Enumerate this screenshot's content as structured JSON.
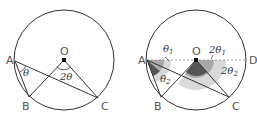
{
  "figures": [
    {
      "id": "left",
      "points": {
        "A": {
          "label": "A",
          "x": 15,
          "y": 61
        },
        "B": {
          "label": "B",
          "x": 29,
          "y": 97
        },
        "C": {
          "label": "C",
          "x": 98,
          "y": 98
        },
        "O": {
          "label": "O",
          "x": 64,
          "y": 60
        }
      },
      "circle": {
        "cx": 64,
        "cy": 61,
        "r": 50
      },
      "angles": [
        {
          "at": "A",
          "label": "θ",
          "sub": ""
        },
        {
          "at": "O",
          "label": "2θ",
          "sub": ""
        }
      ]
    },
    {
      "id": "right",
      "points": {
        "A": {
          "label": "A",
          "x": 147,
          "y": 60
        },
        "B": {
          "label": "B",
          "x": 161,
          "y": 97
        },
        "C": {
          "label": "C",
          "x": 229,
          "y": 97
        },
        "O": {
          "label": "O",
          "x": 196,
          "y": 60
        },
        "D": {
          "label": "D",
          "x": 246,
          "y": 60
        }
      },
      "circle": {
        "cx": 196,
        "cy": 60,
        "r": 50
      },
      "angles": [
        {
          "at": "A",
          "label": "θ",
          "sub": "1"
        },
        {
          "at": "A",
          "label": "θ",
          "sub": "2"
        },
        {
          "at": "O",
          "label": "2θ",
          "sub": "1"
        },
        {
          "at": "O",
          "label": "2θ",
          "sub": "2"
        }
      ]
    }
  ],
  "labels": {
    "left_A": "A",
    "left_B": "B",
    "left_C": "C",
    "left_O": "O",
    "left_theta": "θ",
    "left_2theta": "2θ",
    "right_A": "A",
    "right_B": "B",
    "right_C": "C",
    "right_O": "O",
    "right_D": "D",
    "right_theta": "θ",
    "right_theta1_sub": "1",
    "right_theta2_sub": "2",
    "right_2theta": "2θ",
    "right_2theta1_sub": "1",
    "right_2theta2_sub": "2"
  },
  "colors": {
    "stroke": "#333333",
    "shade_light": "#d9d9d9",
    "shade_mid": "#a8a8a8",
    "shade_dark": "#555555",
    "dashed": "#888888"
  }
}
